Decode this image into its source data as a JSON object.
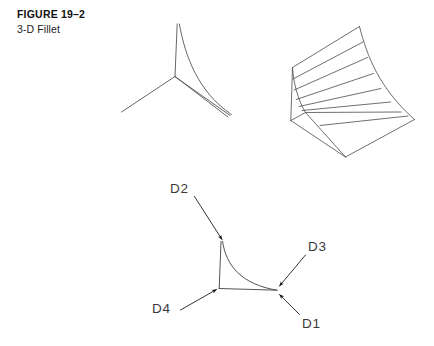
{
  "figure": {
    "number": "FIGURE 19–2",
    "caption": "3-D Fillet",
    "background_color": "#ffffff",
    "line_color": "#4a4a4a",
    "arrow_color": "#111111",
    "label_color": "#3a3a3a"
  },
  "views": {
    "corner_wireframe": {
      "name": "3-way corner junction with fillet (upper left)",
      "vertex": {
        "x": 175,
        "y": 76
      },
      "edges": [
        {
          "name": "vertical-edge",
          "from": {
            "x": 175,
            "y": 76
          },
          "to": {
            "x": 177,
            "y": 24
          }
        },
        {
          "name": "left-leg-edge",
          "from": {
            "x": 175,
            "y": 76
          },
          "to": {
            "x": 122,
            "y": 112
          }
        },
        {
          "name": "right-leg-edge",
          "from": {
            "x": 175,
            "y": 76
          },
          "to": {
            "x": 228,
            "y": 117
          }
        }
      ],
      "fillet_curve": {
        "name": "fillet-surface-boundary",
        "from": {
          "x": 179,
          "y": 24
        },
        "control": {
          "x": 196,
          "y": 84
        },
        "to": {
          "x": 231,
          "y": 114
        }
      }
    },
    "fillet_surface_mesh": {
      "name": "ruled fillet surface mesh (upper right)",
      "isoparametric_line_count": 7,
      "bounds": {
        "x": 288,
        "y": 22,
        "width": 130,
        "height": 140
      }
    },
    "annotated_corner": {
      "name": "annotated corner junction (lower center)",
      "vertex": {
        "x": 219,
        "y": 288
      },
      "right_vertex": {
        "x": 277,
        "y": 290
      },
      "top_vertex": {
        "x": 221,
        "y": 241
      },
      "edges": [
        {
          "name": "vertical-edge",
          "from": {
            "x": 219,
            "y": 288
          },
          "to": {
            "x": 221,
            "y": 241
          }
        },
        {
          "name": "bottom-edge",
          "from": {
            "x": 219,
            "y": 288
          },
          "to": {
            "x": 277,
            "y": 290
          }
        }
      ],
      "fillet_curve": {
        "name": "fillet-boundary-curve",
        "from": {
          "x": 222,
          "y": 241
        },
        "control": {
          "x": 243,
          "y": 284
        },
        "to": {
          "x": 277,
          "y": 290
        }
      }
    }
  },
  "annotations": [
    {
      "id": "D1",
      "label": "D1",
      "label_x": 302,
      "label_y": 328,
      "leader": {
        "from": {
          "x": 299,
          "y": 315
        },
        "to": {
          "x": 279,
          "y": 294
        }
      },
      "description": "first selection point — lower right edge"
    },
    {
      "id": "D2",
      "label": "D2",
      "label_x": 170,
      "label_y": 193,
      "leader": {
        "from": {
          "x": 195,
          "y": 196
        },
        "to": {
          "x": 222,
          "y": 240
        }
      },
      "description": "second selection point — top vertical edge"
    },
    {
      "id": "D3",
      "label": "D3",
      "label_x": 308,
      "label_y": 251,
      "leader": {
        "from": {
          "x": 305,
          "y": 255
        },
        "to": {
          "x": 279,
          "y": 286
        }
      },
      "description": "third selection point — upper right edge"
    },
    {
      "id": "D4",
      "label": "D4",
      "label_x": 152,
      "label_y": 313,
      "leader": {
        "from": {
          "x": 181,
          "y": 310
        },
        "to": {
          "x": 217,
          "y": 289
        }
      },
      "description": "fourth selection point — lower left edge"
    }
  ]
}
